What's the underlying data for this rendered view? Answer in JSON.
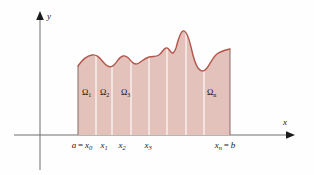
{
  "figure": {
    "colors": {
      "region_fill": "#e2c2ba",
      "curve_stroke": "#b4564c",
      "axis_stroke": "#6e6e6e",
      "divider_stroke": "#f7ece9",
      "text": "#1a1a1a",
      "background": "#fefefe"
    },
    "axes": {
      "x_label": "x",
      "y_label": "y"
    },
    "x_ticks": [
      {
        "name": "a-equals-x0",
        "prefix": "a",
        "operator": "=",
        "symbol": "x",
        "subscript": "0",
        "x": 82
      },
      {
        "name": "x1",
        "prefix": "",
        "operator": "",
        "symbol": "x",
        "subscript": "1",
        "x": 104
      },
      {
        "name": "x2",
        "prefix": "",
        "operator": "",
        "symbol": "x",
        "subscript": "2",
        "x": 122
      },
      {
        "name": "x3",
        "prefix": "",
        "operator": "",
        "symbol": "x",
        "subscript": "3",
        "x": 148
      },
      {
        "name": "xn-equals-b",
        "prefix": "",
        "operator": "=",
        "symbol": "x",
        "subscript": "n",
        "suffix": "b",
        "x": 225
      }
    ],
    "regions": [
      {
        "name": "omega-1",
        "symbol": "Ω",
        "subscript": "1",
        "x": 82,
        "y": 95
      },
      {
        "name": "omega-2",
        "symbol": "Ω",
        "subscript": "2",
        "x": 100,
        "y": 95
      },
      {
        "name": "omega-3",
        "symbol": "Ω",
        "subscript": "3",
        "x": 121,
        "y": 95
      },
      {
        "name": "omega-n",
        "symbol": "Ω",
        "subscript": "n",
        "x": 207,
        "y": 95
      }
    ]
  },
  "chart_data": {
    "type": "area",
    "xlabel": "x",
    "ylabel": "y",
    "grid": false,
    "legend": null,
    "annotations": [
      "a = x₀",
      "x₁",
      "x₂",
      "x₃",
      "xₙ = b",
      "Ω₁",
      "Ω₂",
      "Ω₃",
      "Ωₙ"
    ],
    "interval": {
      "a_label": "a = x₀",
      "b_label": "xₙ = b",
      "a_px": 78,
      "b_px": 230
    },
    "partition_px": [
      78,
      96,
      112,
      131,
      149,
      167,
      186,
      204,
      230
    ],
    "baseline_px_y": 135,
    "curve_path": "M 78 66 C 82 60, 86 56, 92 55 C 98 54, 101 60, 105 64 C 108 67, 111 68, 114 65 C 117 62, 119 57, 123 56 C 127 55, 129 59, 132 62 C 134 64, 136 65, 139 63 C 142 61, 145 58, 149 57 C 153 56, 156 57, 159 55 C 162 53, 163 49, 166 48 C 168 47, 169 50, 171 52 C 173 54, 174 53, 176 48 C 178 40, 180 32, 183 31 C 186 30, 189 38, 191 47 C 193 56, 195 64, 198 68 C 201 72, 204 72, 207 68 C 210 64, 213 57, 217 54 C 221 51, 226 50, 230 49",
    "region_count": 8
  }
}
